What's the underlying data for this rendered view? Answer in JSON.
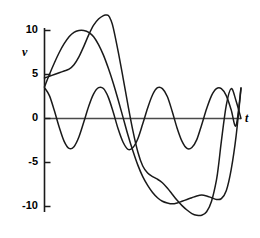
{
  "chart_data": {
    "type": "line",
    "title": "",
    "subtitle": "",
    "xlabel": "t",
    "ylabel": "v",
    "xlim": [
      0,
      8
    ],
    "ylim": [
      -12.5,
      12.5
    ],
    "grid": false,
    "legend": "none",
    "axis_style": "y-axis spine with ticks at left, horizontal zero line for t-axis",
    "ytick_labels": [
      "10",
      "5",
      "0",
      "-5",
      "-10"
    ],
    "ytick_values": [
      10,
      5,
      0,
      -5,
      -10
    ],
    "xtick_labels": [],
    "xtick_values": [],
    "annotations": [],
    "line_color": "#1a1a1a",
    "series": [
      {
        "name": "harmonic-ripple",
        "description": "low-amplitude higher-frequency sinusoid, amplitude about 3.5, four cycles",
        "x": [
          0.0,
          0.2,
          0.4,
          0.6,
          0.8,
          1.0,
          1.2,
          1.4,
          1.6,
          1.8,
          2.0,
          2.2,
          2.4,
          2.6,
          2.8,
          3.0,
          3.2,
          3.4,
          3.6,
          3.8,
          4.0,
          4.2,
          4.4,
          4.6,
          4.8,
          5.0,
          5.2,
          5.4,
          5.6,
          5.8,
          6.0,
          6.2,
          6.4,
          6.6,
          6.8,
          7.0,
          7.2,
          7.4,
          7.6,
          7.8,
          8.0
        ],
        "values": [
          3.5,
          2.6,
          0.9,
          -1.0,
          -2.6,
          -3.4,
          -3.2,
          -2.1,
          -0.4,
          1.4,
          2.8,
          3.5,
          3.4,
          2.4,
          0.7,
          -1.2,
          -2.7,
          -3.5,
          -3.3,
          -2.3,
          -0.6,
          1.2,
          2.7,
          3.5,
          3.4,
          2.5,
          0.8,
          -1.1,
          -2.6,
          -3.4,
          -3.3,
          -2.4,
          -0.7,
          1.1,
          2.6,
          3.4,
          3.4,
          2.6,
          1.0,
          -0.8,
          3.5
        ]
      },
      {
        "name": "broad-arch-wave",
        "description": "smooth large sinusoid, peak about 10 near t=1.7, trough about -10 near t=6.3",
        "x": [
          0.0,
          0.2,
          0.4,
          0.6,
          0.8,
          1.0,
          1.2,
          1.4,
          1.6,
          1.8,
          2.0,
          2.2,
          2.4,
          2.6,
          2.8,
          3.0,
          3.2,
          3.4,
          3.6,
          3.8,
          4.0,
          4.2,
          4.4,
          4.6,
          4.8,
          5.0,
          5.2,
          5.4,
          5.6,
          5.8,
          6.0,
          6.2,
          6.4,
          6.6,
          6.8,
          7.0,
          7.2,
          7.4,
          7.6,
          7.8,
          8.0
        ],
        "values": [
          3.6,
          5.0,
          6.3,
          7.5,
          8.5,
          9.3,
          9.8,
          10.0,
          10.0,
          9.8,
          9.3,
          8.4,
          7.2,
          5.7,
          4.0,
          2.1,
          0.1,
          -1.9,
          -3.7,
          -5.3,
          -6.6,
          -7.6,
          -8.4,
          -9.0,
          -9.4,
          -9.6,
          -9.7,
          -9.6,
          -9.4,
          -9.2,
          -9.0,
          -8.8,
          -8.7,
          -8.8,
          -9.0,
          -9.2,
          -9.1,
          -8.2,
          -5.8,
          -2.0,
          3.4
        ]
      },
      {
        "name": "peaked-composite-wave",
        "description": "composite waveform with sharp crest about 11.7 near t=2.6 and deep trough about -11 near t=7.0",
        "x": [
          0.0,
          0.2,
          0.4,
          0.6,
          0.8,
          1.0,
          1.2,
          1.4,
          1.6,
          1.8,
          2.0,
          2.2,
          2.4,
          2.5,
          2.6,
          2.7,
          2.8,
          3.0,
          3.2,
          3.4,
          3.6,
          3.8,
          4.0,
          4.2,
          4.4,
          4.6,
          4.8,
          5.0,
          5.2,
          5.4,
          5.6,
          5.8,
          6.0,
          6.2,
          6.4,
          6.6,
          6.8,
          7.0,
          7.1,
          7.2,
          7.4,
          7.6,
          7.8,
          8.0
        ],
        "values": [
          4.6,
          4.8,
          5.0,
          5.2,
          5.4,
          5.6,
          6.1,
          7.0,
          8.2,
          9.5,
          10.6,
          11.3,
          11.7,
          11.75,
          11.7,
          11.2,
          10.3,
          7.6,
          4.6,
          1.5,
          -1.4,
          -3.8,
          -5.4,
          -6.2,
          -6.6,
          -6.9,
          -7.3,
          -7.9,
          -8.6,
          -9.3,
          -9.9,
          -10.4,
          -10.8,
          -11.0,
          -11.0,
          -10.6,
          -9.4,
          -7.0,
          -5.0,
          -2.6,
          1.5,
          3.4,
          2.0,
          0.0
        ]
      }
    ]
  },
  "axis": {
    "y_label": "v",
    "x_label": "t"
  },
  "ticks": {
    "y": [
      {
        "label": "10",
        "value": 10
      },
      {
        "label": "5",
        "value": 5
      },
      {
        "label": "0",
        "value": 0
      },
      {
        "label": "-5",
        "value": -5
      },
      {
        "label": "-10",
        "value": -10
      }
    ]
  }
}
